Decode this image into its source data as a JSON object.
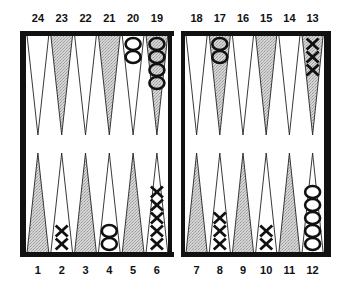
{
  "board": {
    "colors": {
      "frame": "#111111",
      "light_point": "#ffffff",
      "shaded_point": "#c8c8c8",
      "checker_stroke": "#111111"
    },
    "top_left_labels": [
      "24",
      "23",
      "22",
      "21",
      "20",
      "19"
    ],
    "top_right_labels": [
      "18",
      "17",
      "16",
      "15",
      "14",
      "13"
    ],
    "bottom_left_labels": [
      "1",
      "2",
      "3",
      "4",
      "5",
      "6"
    ],
    "bottom_right_labels": [
      "7",
      "8",
      "9",
      "10",
      "11",
      "12"
    ],
    "points": [
      {
        "point": 1,
        "shaded": true,
        "checker": "",
        "count": 0
      },
      {
        "point": 2,
        "shaded": false,
        "checker": "X",
        "count": 2
      },
      {
        "point": 3,
        "shaded": true,
        "checker": "",
        "count": 0
      },
      {
        "point": 4,
        "shaded": false,
        "checker": "O",
        "count": 2
      },
      {
        "point": 5,
        "shaded": true,
        "checker": "",
        "count": 0
      },
      {
        "point": 6,
        "shaded": false,
        "checker": "X",
        "count": 5
      },
      {
        "point": 7,
        "shaded": true,
        "checker": "",
        "count": 0
      },
      {
        "point": 8,
        "shaded": false,
        "checker": "X",
        "count": 3
      },
      {
        "point": 9,
        "shaded": true,
        "checker": "",
        "count": 0
      },
      {
        "point": 10,
        "shaded": false,
        "checker": "X",
        "count": 2
      },
      {
        "point": 11,
        "shaded": true,
        "checker": "",
        "count": 0
      },
      {
        "point": 12,
        "shaded": false,
        "checker": "O",
        "count": 5
      },
      {
        "point": 13,
        "shaded": true,
        "checker": "X",
        "count": 3
      },
      {
        "point": 14,
        "shaded": false,
        "checker": "",
        "count": 0
      },
      {
        "point": 15,
        "shaded": true,
        "checker": "",
        "count": 0
      },
      {
        "point": 16,
        "shaded": false,
        "checker": "",
        "count": 0
      },
      {
        "point": 17,
        "shaded": true,
        "checker": "O",
        "count": 2
      },
      {
        "point": 18,
        "shaded": false,
        "checker": "",
        "count": 0
      },
      {
        "point": 19,
        "shaded": true,
        "checker": "O",
        "count": 4
      },
      {
        "point": 20,
        "shaded": false,
        "checker": "O",
        "count": 2
      },
      {
        "point": 21,
        "shaded": true,
        "checker": "",
        "count": 0
      },
      {
        "point": 22,
        "shaded": false,
        "checker": "",
        "count": 0
      },
      {
        "point": 23,
        "shaded": true,
        "checker": "",
        "count": 0
      },
      {
        "point": 24,
        "shaded": false,
        "checker": "",
        "count": 0
      }
    ]
  }
}
